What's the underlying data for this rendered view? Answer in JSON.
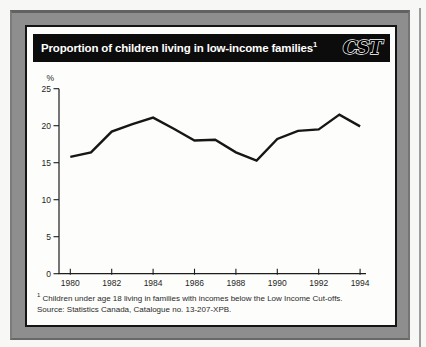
{
  "header": {
    "title": "Proportion of children living in low-income families",
    "title_superscript": "1",
    "logo_text": "CST"
  },
  "footnote": {
    "superscript": "1",
    "line1": "Children under age 18 living in families with incomes below the Low Income Cut-offs.",
    "line2": "Source: Statistics Canada, Catalogue no. 13-207-XPB."
  },
  "chart_data": {
    "type": "line",
    "title": "Proportion of children living in low-income families",
    "ylabel": "%",
    "xlabel": "",
    "x": [
      1980,
      1981,
      1982,
      1983,
      1984,
      1985,
      1986,
      1987,
      1988,
      1989,
      1990,
      1991,
      1992,
      1993,
      1994
    ],
    "values": [
      15.8,
      16.4,
      19.2,
      20.2,
      21.1,
      19.6,
      18.0,
      18.1,
      16.4,
      15.3,
      18.2,
      19.3,
      19.5,
      21.5,
      19.9
    ],
    "ylim": [
      0,
      25
    ],
    "yticks": [
      0,
      5,
      10,
      15,
      20,
      25
    ],
    "xticks": [
      1980,
      1982,
      1984,
      1986,
      1988,
      1990,
      1992,
      1994
    ],
    "grid": false,
    "legend": "none",
    "line_color": "#161616",
    "axis_color": "#1d1d1d",
    "tick_label_color": "#1f1f1f"
  },
  "colors": {
    "panel_gray": "#8e8e8e",
    "card_background": "#fdfdfb",
    "card_border": "#151515",
    "titlebar_background": "#0c0c0c",
    "title_text": "#ffffff",
    "logo_outline": "#ffffff"
  }
}
